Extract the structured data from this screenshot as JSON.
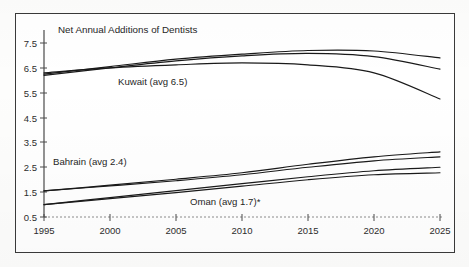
{
  "chart_data": {
    "type": "line",
    "title": "Net Annual Additions of Dentists",
    "xlabel": "",
    "ylabel": "",
    "xlim": [
      1995,
      2025
    ],
    "ylim": [
      0.5,
      7.5
    ],
    "grid": false,
    "legend_position": "inline-annotations",
    "x_ticks": [
      "1995",
      "2000",
      "2005",
      "2010",
      "2015",
      "2020",
      "2025"
    ],
    "y_ticks": [
      "0.5",
      "1.5",
      "2.5",
      "3.5",
      "4.5",
      "5.5",
      "6.5",
      "7.5"
    ],
    "x": [
      1995,
      2000,
      2005,
      2010,
      2015,
      2020,
      2025
    ],
    "annotations": [
      {
        "text": "Kuwait (avg 6.5)",
        "x": 2004,
        "y": 5.85
      },
      {
        "text": "Bahrain (avg 2.4)",
        "x": 1997.5,
        "y": 3.05
      },
      {
        "text": "Oman (avg 1.7)*",
        "x": 2012.5,
        "y": 1.05
      }
    ],
    "series": [
      {
        "name": "Kuwait high",
        "group": "Kuwait",
        "values": [
          6.25,
          6.55,
          6.85,
          7.05,
          7.2,
          7.18,
          6.9
        ]
      },
      {
        "name": "Kuwait mid",
        "group": "Kuwait",
        "values": [
          6.2,
          6.5,
          6.78,
          6.98,
          7.08,
          6.95,
          6.45
        ]
      },
      {
        "name": "Kuwait low",
        "group": "Kuwait",
        "values": [
          6.3,
          6.5,
          6.62,
          6.7,
          6.62,
          6.3,
          5.25
        ]
      },
      {
        "name": "Bahrain high",
        "group": "Bahrain",
        "values": [
          1.55,
          1.78,
          2.02,
          2.28,
          2.62,
          2.92,
          3.12
        ]
      },
      {
        "name": "Bahrain low",
        "group": "Bahrain",
        "values": [
          1.55,
          1.75,
          1.96,
          2.2,
          2.5,
          2.76,
          2.92
        ]
      },
      {
        "name": "Oman high",
        "group": "Oman",
        "values": [
          1.0,
          1.28,
          1.56,
          1.84,
          2.12,
          2.36,
          2.5
        ]
      },
      {
        "name": "Oman low",
        "group": "Oman",
        "values": [
          1.0,
          1.24,
          1.48,
          1.74,
          2.0,
          2.2,
          2.28
        ]
      }
    ]
  },
  "figure": {
    "title": "Net Annual Additions of Dentists",
    "footnote_marker": "*"
  }
}
